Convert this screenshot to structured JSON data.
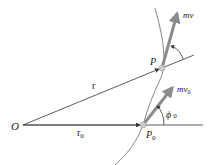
{
  "diagram": {
    "labels": {
      "origin": "O",
      "position_vector": "r",
      "initial_position_vector": "r",
      "initial_position_vector_sub": "0",
      "point": "P",
      "initial_point": "P",
      "initial_point_sub": "0",
      "momentum": "mv",
      "initial_momentum": "mv",
      "initial_momentum_sub": "0",
      "angle": "ϕ",
      "angle_sub": "0"
    },
    "colors": {
      "line": "#333333",
      "arrow": "#8c8c8c",
      "particle": "#c8c8c8",
      "path": "#555555"
    }
  }
}
